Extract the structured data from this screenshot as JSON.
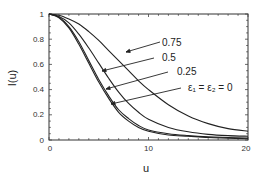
{
  "chart_data": {
    "type": "line",
    "title": "",
    "xlabel": "u",
    "ylabel": "I(u)",
    "xlim": [
      0,
      20
    ],
    "ylim": [
      0,
      1
    ],
    "grid": false,
    "legend": "inline labels with leader arrows",
    "x_ticks": [
      0,
      10,
      20
    ],
    "x_tick_labels": [
      "0",
      "10",
      "20"
    ],
    "y_ticks": [
      0,
      0.2,
      0.4,
      0.6,
      0.8,
      1
    ],
    "y_tick_labels": [
      "0",
      "0.2",
      "0.4",
      "0.6",
      "0.8",
      "1"
    ],
    "x": [
      0,
      1,
      2,
      3,
      4,
      5,
      6,
      7,
      8,
      9,
      10,
      12,
      14,
      16,
      18,
      20
    ],
    "series": [
      {
        "name": "ε1 = ε2 = 0",
        "label": "ε₁ = ε₂ = 0",
        "values": [
          1.0,
          0.97,
          0.89,
          0.76,
          0.61,
          0.46,
          0.33,
          0.22,
          0.15,
          0.1,
          0.07,
          0.04,
          0.03,
          0.02,
          0.015,
          0.01
        ]
      },
      {
        "name": "0.25",
        "label": "0.25",
        "values": [
          1.0,
          0.975,
          0.9,
          0.78,
          0.63,
          0.48,
          0.35,
          0.24,
          0.17,
          0.115,
          0.08,
          0.05,
          0.035,
          0.025,
          0.02,
          0.015
        ]
      },
      {
        "name": "0.5",
        "label": "0.5",
        "values": [
          1.0,
          0.98,
          0.93,
          0.84,
          0.73,
          0.61,
          0.49,
          0.38,
          0.29,
          0.22,
          0.165,
          0.1,
          0.065,
          0.045,
          0.035,
          0.03
        ]
      },
      {
        "name": "0.75",
        "label": "0.75",
        "values": [
          1.0,
          0.99,
          0.96,
          0.92,
          0.86,
          0.79,
          0.71,
          0.63,
          0.55,
          0.47,
          0.4,
          0.28,
          0.19,
          0.13,
          0.09,
          0.07
        ]
      }
    ],
    "annotations": [
      {
        "text": "0.75",
        "points_to": "0.75"
      },
      {
        "text": "0.5",
        "points_to": "0.5"
      },
      {
        "text": "0.25",
        "points_to": "0.25"
      },
      {
        "text": "ε₁ = ε₂ = 0",
        "points_to": "ε1 = ε2 = 0"
      }
    ]
  },
  "labels": {
    "xlabel": "u",
    "ylabel": "I(u)",
    "curve_075": "0.75",
    "curve_05": "0.5",
    "curve_025": "0.25",
    "curve_0": "ε₁ = ε₂ = 0"
  },
  "ticks": {
    "x": [
      "0",
      "10",
      "20"
    ],
    "y": [
      "0",
      "0.2",
      "0.4",
      "0.6",
      "0.8",
      "1"
    ]
  }
}
